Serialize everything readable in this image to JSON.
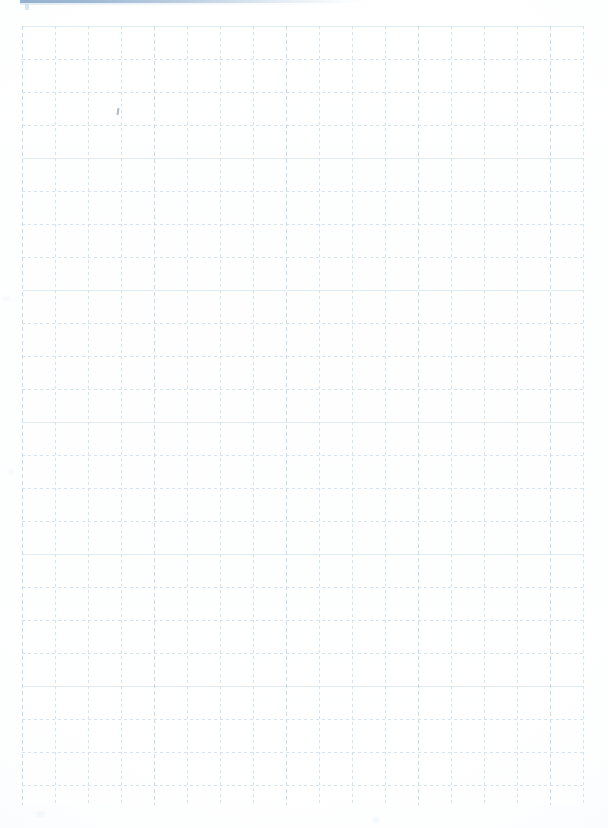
{
  "document": {
    "type": "grid-paper-scan",
    "title": "Blank grid paper page",
    "page_width": 608,
    "page_height": 828,
    "background_color": "#ffffff",
    "text_content": "",
    "has_visible_text": false
  },
  "top_rule": {
    "name": "top-blue-rule",
    "color": "#8eadcc",
    "left": 20,
    "top": 0,
    "width": 352,
    "height": 3,
    "fades_to_right": true
  },
  "grid": {
    "name": "graph-paper-grid",
    "line_color": "#b0cede",
    "line_style": "dashed",
    "cell_size": 33,
    "columns": 17,
    "rows": 24,
    "left": 22,
    "top": 26,
    "width": 562,
    "height": 779,
    "major_line_color": "#a6c7d9",
    "major_every_columns": 4,
    "major_every_rows": 4
  },
  "artifacts": {
    "cursor_mark": {
      "name": "scan-artifact",
      "left": 117,
      "top": 108,
      "color": "#788090"
    },
    "smudges": [
      {
        "left": 3,
        "top": 297,
        "size": 7
      },
      {
        "left": 8,
        "top": 470,
        "size": 6
      },
      {
        "left": 36,
        "top": 812,
        "size": 9
      },
      {
        "left": 372,
        "top": 818,
        "size": 8
      }
    ]
  }
}
